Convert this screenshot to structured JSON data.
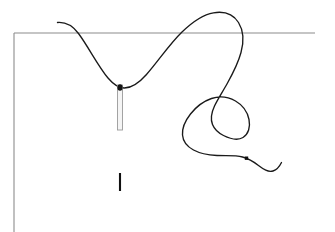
{
  "document": {
    "title": "Needle and Thread Line Drawing",
    "subject": "sewing-needle-thread-illustration",
    "background_color": "#ffffff",
    "width": 335,
    "height": 232
  },
  "palette": {
    "thread_color": "#1a1a1a",
    "frame_color": "#8c8c8c",
    "needle_outline_color": "#9a9a9a",
    "needle_fill_color": "#f5f5f5",
    "needle_eye_color": "#141414",
    "mark_color": "#101010",
    "dot_color": "#101010",
    "background_color": "#ffffff"
  },
  "elements": {
    "frame": {
      "name": "fabric-edge-frame",
      "horizontal_line": {
        "label": "fabric-top-edge",
        "x1": 14,
        "y1": 33,
        "x2": 315,
        "y2": 33,
        "stroke_width": 1.1
      },
      "vertical_line": {
        "label": "fabric-left-edge",
        "x1": 14,
        "y1": 33,
        "x2": 14,
        "y2": 232,
        "stroke_width": 1.1
      }
    },
    "thread": {
      "name": "thread-curve",
      "stroke_width": 1.35,
      "description": "Continuous thread passing through the needle eye, arcing over the fabric edge and coiling into a loop",
      "path": "M 57.5 22.5 C 66 21.8 72.5 25.5 78.5 33.5 C 88.5 47 98 66 108 78 C 113.5 84.5 118.5 87.8 124 88 C 131 88.2 138.5 83.5 146.5 74.5 C 158 61.5 169.5 44 182 32 C 192.5 21.8 203 14.5 213.5 12.8 C 224.5 11 233.5 14.5 238.5 22.5 C 243.5 30.5 244 41.5 241 52.5 C 238 63.5 232.5 74 227.5 83 C 222.5 92 217.5 99.5 214.5 106 C 211 113.5 210.5 119.5 212.5 124.5 C 214.5 129.5 218.5 133 223.5 135.5 C 230.5 139 238 140.5 243 137.5 C 248.5 134.2 250.5 127 249 119.5 C 247.5 112 242.5 105 235.5 101 C 228 96.8 219 96 211.5 98.5 C 203.5 101.2 196 107 190.5 114 C 185 121 182 128.5 182.5 135 C 183 141.5 187 146.5 193.5 150 C 200 153.5 208.5 155 217 155.5 C 226 156 235 155 242.5 157 C 249 158.7 254 162 258.5 165.5 C 263.5 169.3 268 172.5 273 171 C 277 169.8 279.5 166.5 281.5 162.5"
    },
    "needle": {
      "name": "sewing-needle",
      "body": {
        "x": 117.5,
        "y": 85,
        "width": 5,
        "height": 45,
        "stroke_width": 0.9
      },
      "eye": {
        "cx": 120,
        "cy": 87.5,
        "rx": 2.6,
        "ry": 3.2
      }
    },
    "marks": [
      {
        "name": "stitch-mark",
        "type": "vertical-tick",
        "x": 120,
        "y1": 173,
        "y2": 191,
        "stroke_width": 2.1
      }
    ],
    "points": [
      {
        "name": "thread-endpoint-dot",
        "type": "square-dot",
        "cx": 246.5,
        "cy": 158.2,
        "size": 3.4
      }
    ]
  },
  "labels": {
    "caption": "",
    "annotations": []
  }
}
